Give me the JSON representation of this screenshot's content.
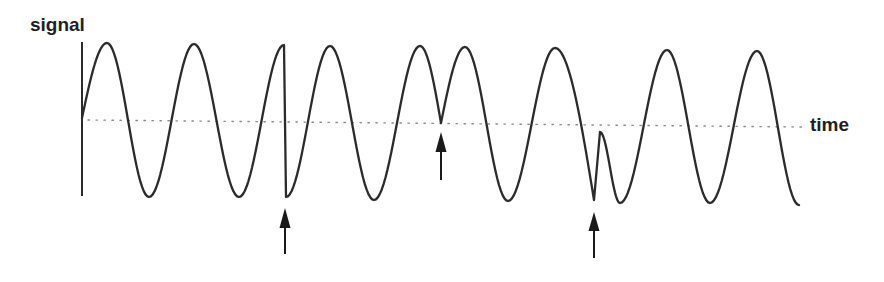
{
  "figure": {
    "ylabel": "signal",
    "xlabel": "time",
    "colors": {
      "line": "#2b2b2b",
      "baseline": "#8a8a8a",
      "arrow": "#1a1a1a",
      "text": "#1f1f1f"
    }
  },
  "chart_data": {
    "type": "line",
    "title": "",
    "xlabel": "time",
    "ylabel": "signal",
    "grid": false,
    "baseline": {
      "style": "dotted",
      "x_start": 88,
      "x_end": 802,
      "y_start": 120,
      "y_end": 127
    },
    "y_axis": {
      "x": 82,
      "y_top": 42,
      "y_bottom": 196
    },
    "keypoints": [
      {
        "x": 82,
        "y": 118,
        "seg": "start"
      },
      {
        "x": 107,
        "y": 43,
        "seg": "quarter_in"
      },
      {
        "x": 149,
        "y": 197,
        "seg": "half"
      },
      {
        "x": 194,
        "y": 44,
        "seg": "half"
      },
      {
        "x": 239,
        "y": 197,
        "seg": "half"
      },
      {
        "x": 284,
        "y": 45,
        "seg": "half"
      },
      {
        "x": 286,
        "y": 197,
        "seg": "line"
      },
      {
        "x": 330,
        "y": 46,
        "seg": "half"
      },
      {
        "x": 374,
        "y": 200,
        "seg": "half"
      },
      {
        "x": 420,
        "y": 46,
        "seg": "half"
      },
      {
        "x": 441,
        "y": 123,
        "seg": "quarter_out"
      },
      {
        "x": 465,
        "y": 47,
        "seg": "quarter_in"
      },
      {
        "x": 508,
        "y": 201,
        "seg": "half"
      },
      {
        "x": 555,
        "y": 48,
        "seg": "half"
      },
      {
        "x": 594,
        "y": 200,
        "seg": "quarter_out"
      },
      {
        "x": 600,
        "y": 132,
        "seg": "line"
      },
      {
        "x": 620,
        "y": 203,
        "seg": "half"
      },
      {
        "x": 667,
        "y": 50,
        "seg": "half"
      },
      {
        "x": 710,
        "y": 203,
        "seg": "half"
      },
      {
        "x": 757,
        "y": 51,
        "seg": "half"
      },
      {
        "x": 799,
        "y": 205,
        "seg": "half"
      }
    ],
    "markers": [
      {
        "type": "arrow-up",
        "x": 285,
        "tip_y": 208,
        "head_base_y": 228,
        "tail_y": 254,
        "label": "discontinuity 1"
      },
      {
        "type": "arrow-up",
        "x": 441,
        "tip_y": 132,
        "head_base_y": 152,
        "tail_y": 180,
        "label": "discontinuity 2"
      },
      {
        "type": "arrow-up",
        "x": 594,
        "tip_y": 212,
        "head_base_y": 231,
        "tail_y": 258,
        "label": "discontinuity 3"
      }
    ]
  }
}
